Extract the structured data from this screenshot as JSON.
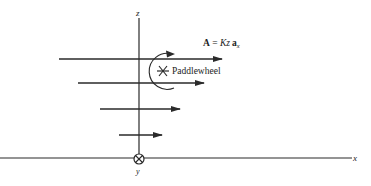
{
  "diagram": {
    "axes": {
      "z_label": "z",
      "x_label": "x",
      "y_label": "y",
      "y_direction_symbol": "⊗"
    },
    "field_label": {
      "bold_part": "A",
      "equals": " = ",
      "italic_part": "Kz",
      "unit_vector": "a",
      "unit_subscript": "x"
    },
    "paddlewheel_label": "Paddlewheel",
    "colors": {
      "line": "#2a2a2a",
      "background": "#ffffff"
    },
    "arrows": [
      {
        "y": 59,
        "x_start": 59,
        "x_end": 222
      },
      {
        "y": 83,
        "x_start": 78,
        "x_end": 204
      },
      {
        "y": 109,
        "x_start": 100,
        "x_end": 180
      },
      {
        "y": 135,
        "x_start": 119,
        "x_end": 162
      }
    ]
  }
}
